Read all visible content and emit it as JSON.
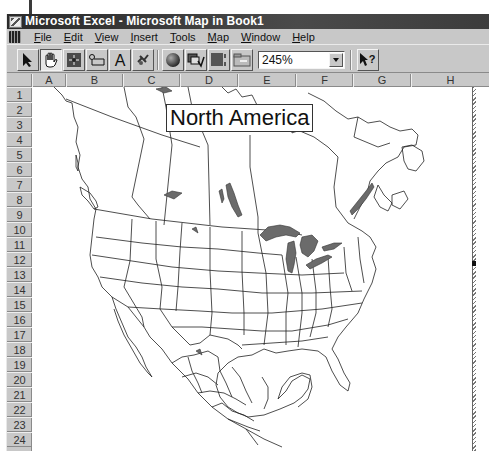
{
  "window": {
    "title": "Microsoft Excel - Microsoft Map in Book1",
    "app_icon": "excel-app-icon"
  },
  "menubar": {
    "doc_icon": "map-document-icon",
    "items": [
      {
        "label": "File",
        "accel": "F"
      },
      {
        "label": "Edit",
        "accel": "E"
      },
      {
        "label": "View",
        "accel": "V"
      },
      {
        "label": "Insert",
        "accel": "I"
      },
      {
        "label": "Tools",
        "accel": "T"
      },
      {
        "label": "Map",
        "accel": "M"
      },
      {
        "label": "Window",
        "accel": "W"
      },
      {
        "label": "Help",
        "accel": "H"
      }
    ]
  },
  "toolbar": {
    "buttons": [
      {
        "name": "select-objects",
        "icon": "arrow-pointer-icon",
        "pressed": false
      },
      {
        "name": "grabber",
        "icon": "hand-grabber-icon",
        "pressed": true
      },
      {
        "name": "center-map",
        "icon": "center-map-icon",
        "pressed": false
      },
      {
        "name": "map-labels",
        "icon": "map-labels-icon",
        "pressed": false
      },
      {
        "name": "add-text",
        "icon": "text-a-icon",
        "pressed": false
      },
      {
        "name": "custom-pin-map",
        "icon": "pushpin-icon",
        "pressed": false
      },
      {
        "name": "display-entire",
        "icon": "globe-icon",
        "pressed": false
      },
      {
        "name": "redraw-map",
        "icon": "redraw-map-icon",
        "pressed": false
      },
      {
        "name": "map-refresh",
        "icon": "map-refresh-icon",
        "pressed": false
      },
      {
        "name": "show-control",
        "icon": "show-control-icon",
        "pressed": false
      },
      {
        "name": "help",
        "icon": "context-help-icon",
        "pressed": false
      }
    ],
    "zoom_value": "245%"
  },
  "sheet": {
    "columns": [
      "A",
      "B",
      "C",
      "D",
      "E",
      "F",
      "G",
      "H"
    ],
    "rows": [
      "1",
      "2",
      "3",
      "4",
      "5",
      "6",
      "7",
      "8",
      "9",
      "10",
      "11",
      "12",
      "13",
      "14",
      "15",
      "16",
      "17",
      "18",
      "19",
      "20",
      "21",
      "22",
      "23",
      "24"
    ]
  },
  "map": {
    "title": "North America",
    "lake_color": "#6b6b6b",
    "border_color": "#222222"
  }
}
